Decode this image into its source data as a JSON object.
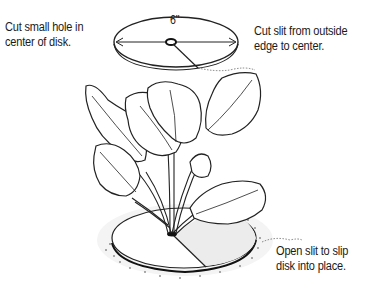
{
  "diagram": {
    "callouts": {
      "hole": "Cut small hole in center of disk.",
      "hole_line1": "Cut small hole in",
      "hole_line2": "center of disk.",
      "slit_line1": "Cut slit from outside",
      "slit_line2": "edge to center.",
      "place_line1": "Open slit to slip",
      "place_line2": "disk into place."
    },
    "dimension": "6\"",
    "elements": [
      "cardboard disk (top view)",
      "diameter arrow",
      "center hole",
      "slit line",
      "leafy plant",
      "disk at base of plant",
      "soil stippling"
    ]
  }
}
